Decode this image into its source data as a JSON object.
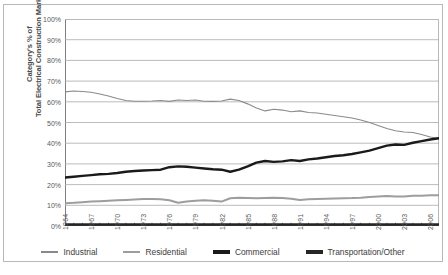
{
  "chart_data": {
    "type": "line",
    "title": "",
    "xlabel": "",
    "ylabel": "Category's % of Total Electrical Construction Market",
    "ylabel_lines": [
      "Category's % of",
      "Total Electrical Construction Market"
    ],
    "ylim": [
      0,
      100
    ],
    "xlim": [
      1964,
      2007
    ],
    "grid": true,
    "legend_position": "bottom",
    "y_ticks": [
      "0%",
      "10%",
      "20%",
      "30%",
      "40%",
      "50%",
      "60%",
      "70%",
      "80%",
      "90%",
      "100%"
    ],
    "y_tick_values": [
      0,
      10,
      20,
      30,
      40,
      50,
      60,
      70,
      80,
      90,
      100
    ],
    "x_tick_labels": [
      "1964",
      "1967",
      "1970",
      "1973",
      "1976",
      "1979",
      "1982",
      "1985",
      "1988",
      "1991",
      "1994",
      "1997",
      "2000",
      "2003",
      "2006"
    ],
    "x_tick_values": [
      1964,
      1967,
      1970,
      1973,
      1976,
      1979,
      1982,
      1985,
      1988,
      1991,
      1994,
      1997,
      2000,
      2003,
      2006
    ],
    "x": [
      1964,
      1965,
      1966,
      1967,
      1968,
      1969,
      1970,
      1971,
      1972,
      1973,
      1974,
      1975,
      1976,
      1977,
      1978,
      1979,
      1980,
      1981,
      1982,
      1983,
      1984,
      1985,
      1986,
      1987,
      1988,
      1989,
      1990,
      1991,
      1992,
      1993,
      1994,
      1995,
      1996,
      1997,
      1998,
      1999,
      2000,
      2001,
      2002,
      2003,
      2004,
      2005,
      2006,
      2007
    ],
    "series": [
      {
        "name": "Industrial",
        "color": "#8a8a8a",
        "width": 1.1,
        "values": [
          64.8,
          65.2,
          65.0,
          64.6,
          63.8,
          62.8,
          61.6,
          60.6,
          60.3,
          60.3,
          60.4,
          60.6,
          60.2,
          60.9,
          60.6,
          60.9,
          60.3,
          60.2,
          60.4,
          61.3,
          60.6,
          59.0,
          57.0,
          55.6,
          56.4,
          56.0,
          55.2,
          55.6,
          54.8,
          54.6,
          54.0,
          53.4,
          52.8,
          52.2,
          51.2,
          50.0,
          48.6,
          47.1,
          46.0,
          45.4,
          45.2,
          44.2,
          43.0,
          42.2
        ]
      },
      {
        "name": "Residential",
        "color": "#9d9d9d",
        "width": 2.0,
        "values": [
          11.0,
          11.2,
          11.5,
          11.8,
          12.0,
          12.2,
          12.4,
          12.6,
          12.8,
          13.0,
          13.1,
          12.9,
          12.4,
          11.2,
          11.8,
          12.2,
          12.4,
          12.2,
          11.8,
          13.4,
          13.6,
          13.5,
          13.4,
          13.5,
          13.6,
          13.5,
          13.2,
          12.6,
          12.9,
          13.1,
          13.2,
          13.3,
          13.4,
          13.5,
          13.7,
          14.0,
          14.3,
          14.5,
          14.2,
          14.3,
          14.6,
          14.6,
          14.8,
          14.9
        ]
      },
      {
        "name": "Commercial",
        "color": "#1a1a1a",
        "width": 2.4,
        "values": [
          23.4,
          23.8,
          24.2,
          24.6,
          25.0,
          25.2,
          25.6,
          26.2,
          26.6,
          26.8,
          27.0,
          27.2,
          28.4,
          28.8,
          28.6,
          28.2,
          27.8,
          27.4,
          27.2,
          26.2,
          27.2,
          28.8,
          30.6,
          31.4,
          31.0,
          31.2,
          31.8,
          31.4,
          32.2,
          32.6,
          33.2,
          33.8,
          34.2,
          34.8,
          35.6,
          36.4,
          37.6,
          38.8,
          39.4,
          39.2,
          40.2,
          41.0,
          41.8,
          42.4
        ]
      },
      {
        "name": "Transportation/Other",
        "color": "#262626",
        "width": 2.6,
        "values": [
          0.7,
          0.7,
          0.7,
          0.7,
          0.7,
          0.7,
          0.7,
          0.7,
          0.7,
          0.7,
          0.7,
          0.7,
          0.7,
          0.7,
          0.7,
          0.7,
          0.7,
          0.7,
          0.7,
          0.7,
          0.7,
          0.7,
          0.7,
          0.7,
          0.7,
          0.7,
          0.7,
          0.7,
          0.7,
          0.7,
          0.7,
          0.7,
          0.7,
          0.7,
          0.7,
          0.7,
          0.7,
          0.7,
          0.7,
          0.7,
          0.7,
          0.7,
          0.7,
          0.7
        ]
      }
    ],
    "legend": [
      {
        "label": "Industrial",
        "color": "#8a8a8a",
        "thickness": 1.4
      },
      {
        "label": "Residential",
        "color": "#9d9d9d",
        "thickness": 2.6
      },
      {
        "label": "Commercial",
        "color": "#1a1a1a",
        "thickness": 3.2
      },
      {
        "label": "Transportation/Other",
        "color": "#262626",
        "thickness": 4.2
      }
    ]
  }
}
